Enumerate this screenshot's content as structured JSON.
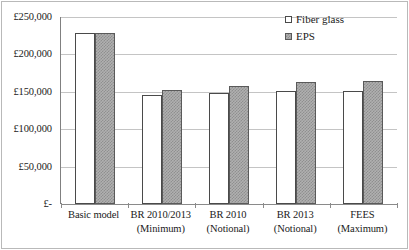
{
  "chart_data": {
    "type": "bar",
    "title": "",
    "subtitle": "",
    "xlabel": "",
    "ylabel": "",
    "grid": true,
    "legend_position": "top-right",
    "currency_symbol": "£",
    "categories": [
      "Basic model",
      "BR 2010/2013\n(Minimum)",
      "BR 2010\n(Notional)",
      "BR 2013\n(Notional)",
      "FEES\n(Maximum)"
    ],
    "category_lines": [
      [
        "Basic model",
        ""
      ],
      [
        "BR 2010/2013",
        "(Minimum)"
      ],
      [
        "BR 2010",
        "(Notional)"
      ],
      [
        "BR 2013",
        "(Notional)"
      ],
      [
        "FEES",
        "(Maximum)"
      ]
    ],
    "series": [
      {
        "name": "Fiber glass",
        "values": [
          229000,
          146000,
          148500,
          151000,
          151000
        ]
      },
      {
        "name": "EPS",
        "values": [
          228500,
          152000,
          157500,
          162500,
          164500
        ]
      }
    ],
    "ylim": [
      0,
      250000
    ],
    "ytick_values": [
      250000,
      200000,
      150000,
      100000,
      50000,
      0
    ],
    "ytick_labels": [
      "£250,000",
      "£200,000",
      "£150,000",
      "£100,000",
      "£50,000",
      "£-"
    ]
  },
  "legend": {
    "items": [
      {
        "label": "Fiber glass",
        "swatch": "white-square-outline"
      },
      {
        "label": "EPS",
        "swatch": "grey-checkered-square"
      }
    ]
  },
  "colors": {
    "fiber_glass_fill": "#ffffff",
    "fiber_glass_border": "#4a4a4a",
    "eps_fill": "#b0b0b0",
    "eps_pattern": "#8f8f8f",
    "eps_border": "#5a5a5a",
    "gridline": "#c4c4c4",
    "axis": "#8a8a8a",
    "frame": "#b9b9b9",
    "text": "#1a1a1a",
    "background": "#ffffff"
  }
}
